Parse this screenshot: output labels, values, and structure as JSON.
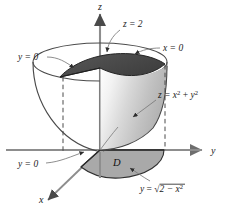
{
  "figure": {
    "type": "math-3d-solid-diagram",
    "title_text": "",
    "background_color": "#ffffff",
    "axes": {
      "z_label": "z",
      "y_label": "y",
      "x_label": "x",
      "axis_color": "#8d8d8d"
    },
    "labels": {
      "plane_top": "z = 2",
      "plane_x_zero": "x = 0",
      "plane_y_zero_upper": "y = 0",
      "plane_y_zero_lower": "y = 0",
      "surface": "z = x² + y²",
      "surface_base": "z = ",
      "surface_x": "x",
      "surface_x_exp": "2",
      "surface_plus": " + ",
      "surface_y": "y",
      "surface_y_exp": "2",
      "boundary_curve": "y = √(2 − x²)",
      "boundary_y": "y",
      "boundary_eq": " = ",
      "boundary_radical": "√",
      "boundary_inner": "2 − x",
      "boundary_inner_exp": "2",
      "region": "D"
    },
    "colors": {
      "top_cut_face": "#4d4d4d",
      "paraboloid_inner_light": "#ffffff",
      "paraboloid_inner_dark": "#b4b4b4",
      "base_region": "#a9a9a9",
      "outline": "#3a3a3a",
      "leader_line": "#6e6e6e",
      "dashed_line": "#4a4a4a"
    },
    "geometry": {
      "origin_x": 100,
      "origin_y": 150,
      "z_axis_top_y": 8,
      "y_axis_right_x": 208,
      "top_ellipse_cy": 62,
      "top_ellipse_rx": 67,
      "top_ellipse_ry": 19
    }
  }
}
